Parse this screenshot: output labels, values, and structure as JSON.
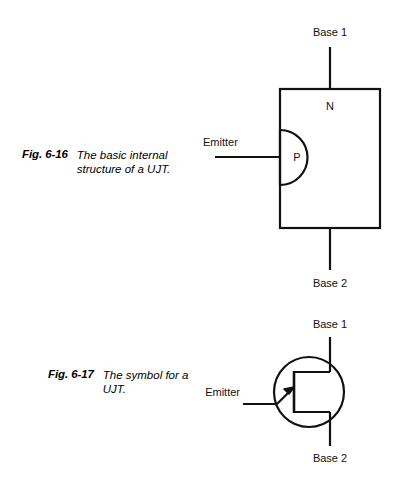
{
  "page": {
    "background_color": "#ffffff",
    "ink_color": "#111111"
  },
  "figures": [
    {
      "id": "fig-6-16",
      "number_label": "Fig. 6-16",
      "caption_lines": [
        "The basic internal",
        "structure of a UJT."
      ],
      "caption_text": "The basic internal structure of a UJT.",
      "diagram": {
        "type": "ujt-internal-structure",
        "terminals": [
          {
            "name": "base-1",
            "label": "Base 1"
          },
          {
            "name": "emitter",
            "label": "Emitter"
          },
          {
            "name": "base-2",
            "label": "Base 2"
          }
        ],
        "regions": [
          {
            "name": "n-type-bar",
            "label": "N"
          },
          {
            "name": "p-type-region",
            "label": "P"
          }
        ]
      }
    },
    {
      "id": "fig-6-17",
      "number_label": "Fig. 6-17",
      "caption_lines": [
        "The symbol for a",
        "UJT."
      ],
      "caption_text": "The symbol for a UJT.",
      "diagram": {
        "type": "ujt-schematic-symbol",
        "terminals": [
          {
            "name": "base-1",
            "label": "Base 1"
          },
          {
            "name": "emitter",
            "label": "Emitter"
          },
          {
            "name": "base-2",
            "label": "Base 2"
          }
        ],
        "regions": []
      }
    }
  ],
  "labels": {
    "base1_top": "Base 1",
    "base2_bottom": "Base 2",
    "emitter_fig1": "Emitter",
    "n_region": "N",
    "p_region": "P",
    "base1_sym": "Base 1",
    "base2_sym": "Base 2",
    "emitter_fig2": "Emitter"
  }
}
